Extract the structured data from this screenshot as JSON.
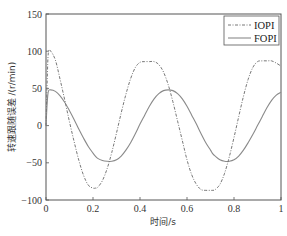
{
  "chart_data": {
    "type": "line",
    "title": "",
    "xlabel": "时间/s",
    "ylabel": "转速跟随误差 /(r/min)",
    "xlim": [
      0,
      1
    ],
    "ylim": [
      -100,
      150
    ],
    "x_ticks": [
      "0",
      "0.2",
      "0.4",
      "0.6",
      "0.8",
      "1"
    ],
    "y_ticks": [
      "150",
      "100",
      "50",
      "0",
      "-50",
      "-100"
    ],
    "grid": false,
    "legend_position": "upper right",
    "x": [
      0,
      0.005,
      0.01,
      0.02,
      0.04,
      0.06,
      0.08,
      0.1,
      0.12,
      0.14,
      0.16,
      0.18,
      0.2,
      0.21,
      0.22,
      0.24,
      0.26,
      0.28,
      0.3,
      0.32,
      0.34,
      0.36,
      0.38,
      0.4,
      0.42,
      0.44,
      0.46,
      0.48,
      0.5,
      0.52,
      0.54,
      0.56,
      0.58,
      0.6,
      0.62,
      0.64,
      0.66,
      0.68,
      0.7,
      0.71,
      0.72,
      0.74,
      0.76,
      0.78,
      0.8,
      0.82,
      0.84,
      0.86,
      0.88,
      0.9,
      0.92,
      0.94,
      0.96,
      0.98,
      1.0
    ],
    "series": [
      {
        "name": "IOPI",
        "style": "dash-dot",
        "color": "#777777",
        "values": [
          0,
          60,
          98,
          100,
          88,
          62,
          34,
          5,
          -22,
          -47,
          -67,
          -80,
          -84,
          -84,
          -83,
          -74,
          -58,
          -36,
          -10,
          17,
          42,
          63,
          78,
          85,
          86,
          86,
          86,
          82,
          72,
          55,
          32,
          6,
          -20,
          -46,
          -66,
          -79,
          -86,
          -87,
          -87,
          -87,
          -86,
          -79,
          -64,
          -42,
          -16,
          12,
          39,
          62,
          78,
          86,
          87,
          87,
          87,
          84,
          80
        ]
      },
      {
        "name": "FOPI",
        "style": "solid",
        "color": "#8a8a8a",
        "values": [
          0,
          30,
          46,
          48,
          46,
          40,
          31,
          20,
          8,
          -5,
          -17,
          -28,
          -37,
          -41,
          -44,
          -47,
          -48,
          -48,
          -46,
          -41,
          -33,
          -23,
          -11,
          2,
          14,
          26,
          36,
          43,
          47,
          48,
          47,
          43,
          36,
          26,
          14,
          2,
          -11,
          -23,
          -33,
          -38,
          -41,
          -46,
          -48,
          -48,
          -46,
          -41,
          -33,
          -23,
          -12,
          0,
          12,
          24,
          34,
          41,
          45
        ]
      }
    ]
  }
}
